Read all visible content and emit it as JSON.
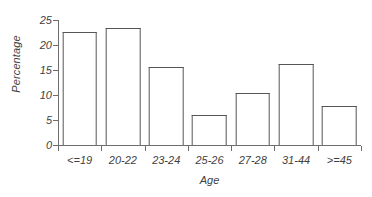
{
  "chart_data": {
    "type": "bar",
    "title": "",
    "xlabel": "Age",
    "ylabel": "Percentage",
    "categories": [
      "<=19",
      "20-22",
      "23-24",
      "25-26",
      "27-28",
      "31-44",
      ">=45"
    ],
    "values": [
      22.6,
      23.4,
      15.6,
      6.0,
      10.4,
      16.2,
      7.8
    ],
    "ylim": [
      0,
      25
    ],
    "yticks": [
      0,
      5,
      10,
      15,
      20,
      25
    ],
    "ytick_labels": [
      "0",
      "5",
      "10",
      "15",
      "20",
      "25"
    ],
    "grid": false,
    "legend": null,
    "bar_fill_color": "#ffffff",
    "bar_edge_color": "#565656",
    "axis_color": "#6d6d6d",
    "text_color": "#3f3f3f",
    "background_color": "#ffffff"
  }
}
